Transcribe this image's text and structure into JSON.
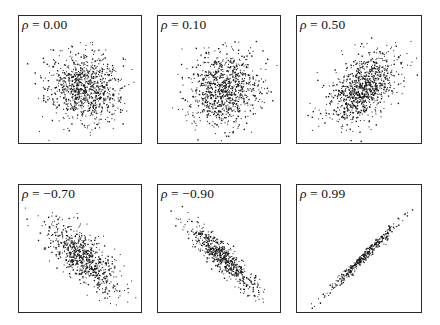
{
  "chart_data": [
    {
      "type": "scatter",
      "title": "ρ = 0.00",
      "symbol": "ρ",
      "rho_label": "0.00",
      "rho": 0.0,
      "n_points": 900,
      "xlabel": "",
      "ylabel": "",
      "axes": "none",
      "grid": false,
      "point_color": "#1a1a1a",
      "title_placement": "top-left"
    },
    {
      "type": "scatter",
      "title": "ρ = 0.10",
      "symbol": "ρ",
      "rho_label": "0.10",
      "rho": 0.1,
      "n_points": 900,
      "xlabel": "",
      "ylabel": "",
      "axes": "none",
      "grid": false,
      "point_color": "#1a1a1a",
      "title_placement": "top-left"
    },
    {
      "type": "scatter",
      "title": "ρ = 0.50",
      "symbol": "ρ",
      "rho_label": "0.50",
      "rho": 0.5,
      "n_points": 900,
      "xlabel": "",
      "ylabel": "",
      "axes": "none",
      "grid": false,
      "point_color": "#1a1a1a",
      "title_placement": "top-left"
    },
    {
      "type": "scatter",
      "title": "ρ = −0.70",
      "symbol": "ρ",
      "rho_label": "−0.70",
      "rho": -0.7,
      "n_points": 700,
      "xlabel": "",
      "ylabel": "",
      "axes": "none",
      "grid": false,
      "point_color": "#1a1a1a",
      "title_placement": "top-left"
    },
    {
      "type": "scatter",
      "title": "ρ = −0.90",
      "symbol": "ρ",
      "rho_label": "−0.90",
      "rho": -0.9,
      "n_points": 600,
      "xlabel": "",
      "ylabel": "",
      "axes": "none",
      "grid": false,
      "point_color": "#1a1a1a",
      "title_placement": "top-left"
    },
    {
      "type": "scatter",
      "title": "ρ = 0.99",
      "symbol": "ρ",
      "rho_label": "0.99",
      "rho": 0.99,
      "n_points": 350,
      "xlabel": "",
      "ylabel": "",
      "axes": "none",
      "grid": false,
      "point_color": "#1a1a1a",
      "title_placement": "top-left"
    }
  ]
}
